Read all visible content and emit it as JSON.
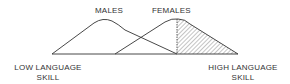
{
  "diagram": {
    "labels": {
      "males": "MALES",
      "females": "FEMALES",
      "low_skill_line1": "LOW LANGUAGE",
      "low_skill_line2": "SKILL",
      "high_skill_line1": "HIGH LANGUAGE",
      "high_skill_line2": "SKILL"
    },
    "colors": {
      "line": "#333333",
      "hatch": "#555555",
      "background": "#ffffff"
    },
    "curves": [
      {
        "name": "males",
        "description": "distribution curve shifted toward low language skill"
      },
      {
        "name": "females",
        "description": "distribution curve shifted toward high language skill; upper tail hatched"
      }
    ]
  }
}
